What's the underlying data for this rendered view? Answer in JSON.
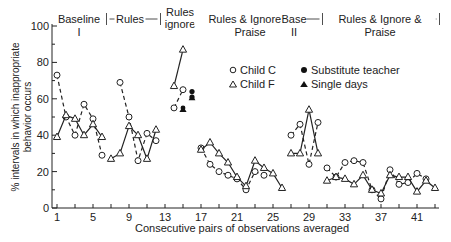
{
  "chart_data": {
    "type": "line",
    "title": "",
    "xlabel": "Consecutive pairs of observations averaged",
    "ylabel": "% intervals in which inappropriate behavior occurs",
    "ylim": [
      0,
      100
    ],
    "xlim": [
      1,
      43
    ],
    "xticks": [
      1,
      5,
      9,
      13,
      17,
      21,
      25,
      29,
      33,
      37,
      41
    ],
    "yticks": [
      0,
      20,
      40,
      60,
      80,
      100
    ],
    "phases": [
      {
        "label": "Baseline I",
        "start": 0.5,
        "end": 6.5
      },
      {
        "label": "Rules",
        "start": 6.5,
        "end": 12.5
      },
      {
        "label": "Rules ignore",
        "start": 12.5,
        "end": 15.5
      },
      {
        "label": "Rules & Ignore & Praise",
        "start": 15.5,
        "end": 26.5
      },
      {
        "label": "Base II",
        "start": 26.5,
        "end": 30.5
      },
      {
        "label": "Rules & Ignore & Praise",
        "start": 30.5,
        "end": 43.5
      }
    ],
    "legend": [
      {
        "label": "Child C",
        "marker": "circle-open",
        "line": "dashed"
      },
      {
        "label": "Child F",
        "marker": "triangle-open",
        "line": "solid"
      },
      {
        "label": "Substitute teacher",
        "marker": "circle-filled"
      },
      {
        "label": "Single days",
        "marker": "triangle-filled"
      }
    ],
    "series": [
      {
        "name": "Child C",
        "segments": [
          [
            [
              1,
              73
            ],
            [
              2,
              50
            ],
            [
              3,
              40
            ],
            [
              4,
              57
            ],
            [
              5,
              49
            ],
            [
              6,
              29
            ]
          ],
          [
            [
              8,
              69
            ],
            [
              9,
              50
            ],
            [
              10,
              26
            ],
            [
              11,
              41
            ],
            [
              12,
              37
            ]
          ],
          [
            [
              14,
              55
            ],
            [
              15,
              65
            ]
          ],
          [
            [
              17,
              33
            ],
            [
              18,
              24
            ],
            [
              19,
              20
            ],
            [
              20,
              18
            ],
            [
              21,
              16
            ],
            [
              22,
              10
            ],
            [
              23,
              20
            ],
            [
              24,
              18
            ]
          ],
          [
            [
              27,
              40
            ],
            [
              28,
              46
            ],
            [
              29,
              24
            ],
            [
              30,
              47
            ]
          ],
          [
            [
              31,
              22
            ],
            [
              32,
              17
            ],
            [
              33,
              25
            ],
            [
              34,
              26
            ],
            [
              35,
              25
            ],
            [
              36,
              10
            ],
            [
              37,
              5
            ],
            [
              38,
              21
            ],
            [
              39,
              13
            ],
            [
              40,
              14
            ],
            [
              41,
              19
            ],
            [
              42,
              16
            ]
          ]
        ]
      },
      {
        "name": "Child F",
        "segments": [
          [
            [
              1,
              39
            ],
            [
              2,
              51
            ],
            [
              3,
              49
            ],
            [
              4,
              40
            ],
            [
              5,
              46
            ],
            [
              6,
              39
            ]
          ],
          [
            [
              7,
              27
            ],
            [
              8,
              30
            ],
            [
              9,
              45
            ],
            [
              10,
              40
            ],
            [
              11,
              27
            ],
            [
              12,
              43
            ]
          ],
          [
            [
              14,
              67
            ],
            [
              15,
              87
            ]
          ],
          [
            [
              17,
              32
            ],
            [
              18,
              36
            ],
            [
              19,
              30
            ],
            [
              20,
              25
            ],
            [
              21,
              17
            ],
            [
              22,
              12
            ],
            [
              23,
              26
            ],
            [
              24,
              22
            ],
            [
              25,
              19
            ],
            [
              26,
              11
            ]
          ],
          [
            [
              27,
              30
            ],
            [
              28,
              30
            ],
            [
              29,
              54
            ],
            [
              30,
              30
            ]
          ],
          [
            [
              31,
              15
            ],
            [
              32,
              17
            ],
            [
              33,
              16
            ],
            [
              34,
              13
            ],
            [
              35,
              18
            ],
            [
              36,
              10
            ],
            [
              37,
              8
            ],
            [
              38,
              18
            ],
            [
              39,
              17
            ],
            [
              40,
              17
            ],
            [
              41,
              9
            ],
            [
              42,
              15
            ],
            [
              43,
              11
            ]
          ]
        ]
      }
    ],
    "annotations": [
      {
        "type": "Substitute teacher",
        "x": 16,
        "y": 61
      },
      {
        "type": "Substitute teacher",
        "x": 16,
        "y": 63
      },
      {
        "type": "Single days",
        "x": 15,
        "y": 53
      },
      {
        "type": "Single days",
        "x": 16,
        "y": 61
      }
    ]
  }
}
